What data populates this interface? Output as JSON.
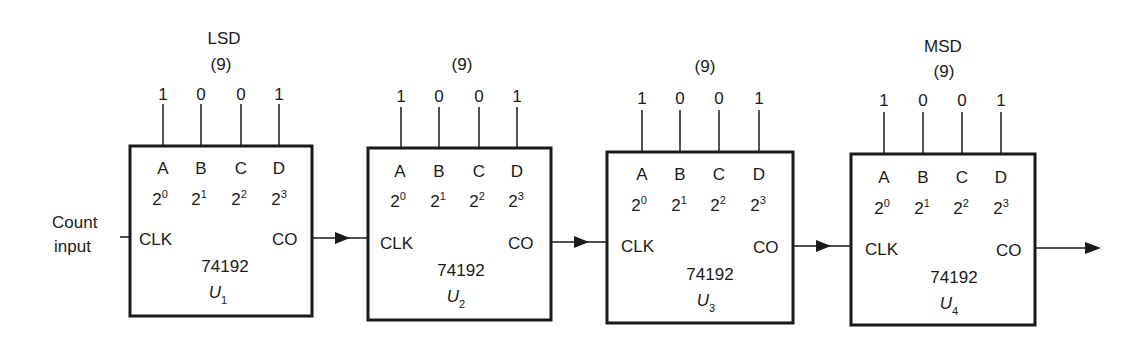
{
  "diagram": {
    "input_label_line1": "Count",
    "input_label_line2": "input",
    "counters": [
      {
        "id": "U1",
        "ref_letter": "U",
        "ref_sub": "1",
        "part": "74192",
        "digit_label": "LSD",
        "value_label": "(9)",
        "pins": [
          "A",
          "B",
          "C",
          "D"
        ],
        "weights": [
          {
            "b": "2",
            "e": "0"
          },
          {
            "b": "2",
            "e": "1"
          },
          {
            "b": "2",
            "e": "2"
          },
          {
            "b": "2",
            "e": "3"
          }
        ],
        "bits": [
          "1",
          "0",
          "0",
          "1"
        ],
        "clk": "CLK",
        "co": "CO"
      },
      {
        "id": "U2",
        "ref_letter": "U",
        "ref_sub": "2",
        "part": "74192",
        "digit_label": "",
        "value_label": "(9)",
        "pins": [
          "A",
          "B",
          "C",
          "D"
        ],
        "weights": [
          {
            "b": "2",
            "e": "0"
          },
          {
            "b": "2",
            "e": "1"
          },
          {
            "b": "2",
            "e": "2"
          },
          {
            "b": "2",
            "e": "3"
          }
        ],
        "bits": [
          "1",
          "0",
          "0",
          "1"
        ],
        "clk": "CLK",
        "co": "CO"
      },
      {
        "id": "U3",
        "ref_letter": "U",
        "ref_sub": "3",
        "part": "74192",
        "digit_label": "",
        "value_label": "(9)",
        "pins": [
          "A",
          "B",
          "C",
          "D"
        ],
        "weights": [
          {
            "b": "2",
            "e": "0"
          },
          {
            "b": "2",
            "e": "1"
          },
          {
            "b": "2",
            "e": "2"
          },
          {
            "b": "2",
            "e": "3"
          }
        ],
        "bits": [
          "1",
          "0",
          "0",
          "1"
        ],
        "clk": "CLK",
        "co": "CO"
      },
      {
        "id": "U4",
        "ref_letter": "U",
        "ref_sub": "4",
        "part": "74192",
        "digit_label": "MSD",
        "value_label": "(9)",
        "pins": [
          "A",
          "B",
          "C",
          "D"
        ],
        "weights": [
          {
            "b": "2",
            "e": "0"
          },
          {
            "b": "2",
            "e": "1"
          },
          {
            "b": "2",
            "e": "2"
          },
          {
            "b": "2",
            "e": "3"
          }
        ],
        "bits": [
          "1",
          "0",
          "0",
          "1"
        ],
        "clk": "CLK",
        "co": "CO"
      }
    ]
  }
}
